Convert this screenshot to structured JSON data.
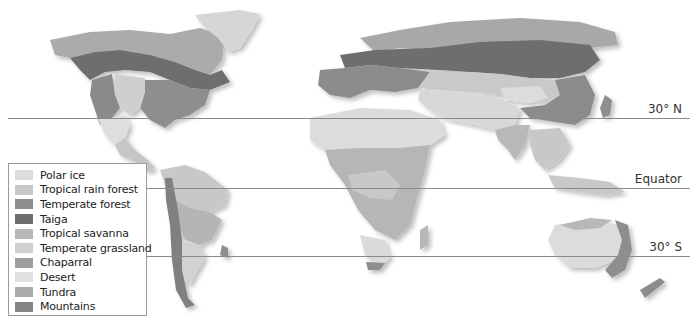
{
  "map": {
    "title": "World biomes",
    "latitude_lines": [
      {
        "label": "30° N",
        "y": 118
      },
      {
        "label": "Equator",
        "y": 188
      },
      {
        "label": "30° S",
        "y": 256
      }
    ]
  },
  "legend": {
    "items": [
      {
        "label": "Polar ice",
        "color": "#dcdcdc"
      },
      {
        "label": "Tropical rain forest",
        "color": "#c8c8c8"
      },
      {
        "label": "Temperate forest",
        "color": "#8e8e8e"
      },
      {
        "label": "Taiga",
        "color": "#6e6e6e"
      },
      {
        "label": "Tropical savanna",
        "color": "#b8b8b8"
      },
      {
        "label": "Temperate grassland",
        "color": "#cfcfcf"
      },
      {
        "label": "Chaparral",
        "color": "#9e9e9e"
      },
      {
        "label": "Desert",
        "color": "#e0e0e0"
      },
      {
        "label": "Tundra",
        "color": "#aaaaaa"
      },
      {
        "label": "Mountains",
        "color": "#858585"
      }
    ]
  }
}
